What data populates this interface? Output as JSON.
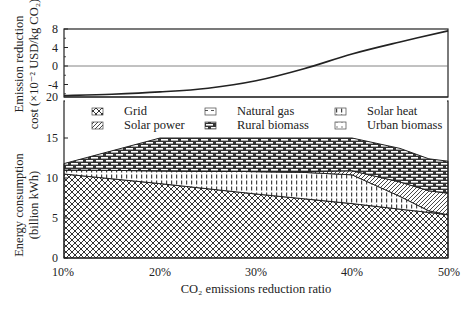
{
  "chart_data": [
    {
      "type": "line",
      "panel": "top",
      "ylabel": "Emission reduction cost (×10⁻² USD/kg CO₂)",
      "ylabel_lines": [
        "Emission reduction",
        "cost (×10⁻² USD/kg CO₂)"
      ],
      "yticks": [
        8,
        4,
        0,
        -4
      ],
      "ylim": [
        -7,
        8
      ],
      "axis_break_label": "20",
      "zero_line": true,
      "x": [
        10,
        15,
        20,
        25,
        30,
        35,
        40,
        45,
        50
      ],
      "series": [
        {
          "name": "Emission reduction cost",
          "values": [
            -6.4,
            -6.1,
            -5.6,
            -4.8,
            -3.2,
            -0.6,
            2.6,
            5.2,
            7.6
          ]
        }
      ]
    },
    {
      "type": "area",
      "panel": "bottom",
      "stacked": true,
      "xlabel": "CO₂ emissions reduction ratio",
      "ylabel": "Energy consumption (billion kWh)",
      "ylabel_lines": [
        "Energy consumption",
        "(billion kWh)"
      ],
      "xticks": [
        "10%",
        "20%",
        "30%",
        "40%",
        "50%"
      ],
      "yticks": [
        0,
        5,
        10,
        15
      ],
      "ylim": [
        0,
        20
      ],
      "x": [
        10,
        20,
        30,
        35,
        40,
        45,
        48,
        50
      ],
      "series": [
        {
          "name": "Grid",
          "pattern": "crosshatch",
          "values": [
            10.5,
            9.3,
            8.0,
            7.4,
            6.8,
            6.1,
            5.7,
            5.4
          ]
        },
        {
          "name": "Solar heat",
          "pattern": "dashes",
          "values": [
            0.5,
            1.6,
            2.8,
            3.3,
            3.6,
            1.6,
            0.2,
            0.0
          ]
        },
        {
          "name": "Solar power",
          "pattern": "diagonal",
          "values": [
            0.0,
            0.0,
            0.0,
            0.1,
            0.5,
            1.8,
            2.5,
            2.7
          ]
        },
        {
          "name": "Rural biomass",
          "pattern": "brick",
          "values": [
            0.8,
            4.1,
            4.2,
            4.2,
            4.1,
            4.2,
            4.0,
            4.0
          ]
        },
        {
          "name": "Natural gas",
          "pattern": "dashes-sparse",
          "values": [
            0,
            0,
            0,
            0,
            0,
            0,
            0,
            0
          ]
        },
        {
          "name": "Urban biomass",
          "pattern": "dots-sparse",
          "values": [
            0,
            0,
            0,
            0,
            0,
            0,
            0,
            0
          ]
        }
      ],
      "legend": {
        "placement": "top",
        "entries": [
          {
            "name": "Grid",
            "pattern": "crosshatch"
          },
          {
            "name": "Natural gas",
            "pattern": "dashes-sparse"
          },
          {
            "name": "Solar heat",
            "pattern": "dashes"
          },
          {
            "name": "Solar power",
            "pattern": "diagonal"
          },
          {
            "name": "Rural biomass",
            "pattern": "brick"
          },
          {
            "name": "Urban biomass",
            "pattern": "dots-sparse"
          }
        ]
      }
    }
  ]
}
